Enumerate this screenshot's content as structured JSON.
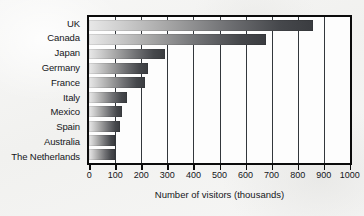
{
  "chart_data": {
    "type": "bar",
    "orientation": "horizontal",
    "title": "",
    "xlabel": "Number of visitors (thousands)",
    "ylabel": "",
    "categories": [
      "UK",
      "Canada",
      "Japan",
      "Germany",
      "France",
      "Italy",
      "Mexico",
      "Spain",
      "Australia",
      "The Netherlands"
    ],
    "values": [
      860,
      680,
      290,
      225,
      215,
      145,
      128,
      118,
      100,
      98
    ],
    "xlim": [
      0,
      1000
    ],
    "xticks": [
      0,
      100,
      200,
      300,
      400,
      500,
      600,
      700,
      800,
      900,
      1000
    ],
    "xtick_labels": [
      "0",
      "100",
      "200",
      "300",
      "400",
      "500",
      "600",
      "700",
      "800",
      "900",
      "1000"
    ],
    "grid": true,
    "grid_axis": "x",
    "legend": false,
    "bar_fill": "gradient-light-to-dark-gray",
    "colors": {
      "bar_start": "#e8e8e8",
      "bar_end": "#3a3c40",
      "plot_border": "#0b0b0b",
      "gridline": "#33373c",
      "plot_background": "#fdfdfd",
      "page_background": "#f4f4f3",
      "text": "#14161a"
    }
  }
}
